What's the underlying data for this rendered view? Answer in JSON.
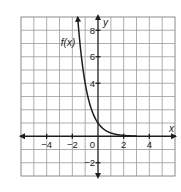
{
  "chart_data": {
    "type": "line",
    "title": "",
    "xlabel": "x",
    "ylabel": "y",
    "xlim": [
      -6,
      6
    ],
    "ylim": [
      -3,
      9
    ],
    "grid": true,
    "x_ticks": [
      -4,
      -2,
      2,
      4
    ],
    "y_ticks": [
      8,
      6,
      4,
      -2
    ],
    "x_tick_labels": [
      "−4",
      "−2",
      "2",
      "4"
    ],
    "y_tick_labels": [
      "8",
      "6",
      "4",
      "−2"
    ],
    "origin_label": "0",
    "series": [
      {
        "name": "f(x)",
        "label": "f(x)",
        "formula": "(1/4)^x",
        "domain_shown": [
          -1.58,
          3
        ],
        "points": [
          [
            -1.5,
            8
          ],
          [
            -1,
            4
          ],
          [
            -0.5,
            2
          ],
          [
            0,
            1
          ],
          [
            0.5,
            0.5
          ],
          [
            1,
            0.25
          ],
          [
            2,
            0.0625
          ],
          [
            3,
            0.0156
          ]
        ],
        "arrow_at_start": true
      }
    ],
    "colors": {
      "curve": "#1e1e1e",
      "grid": "#9a9a9a"
    }
  }
}
